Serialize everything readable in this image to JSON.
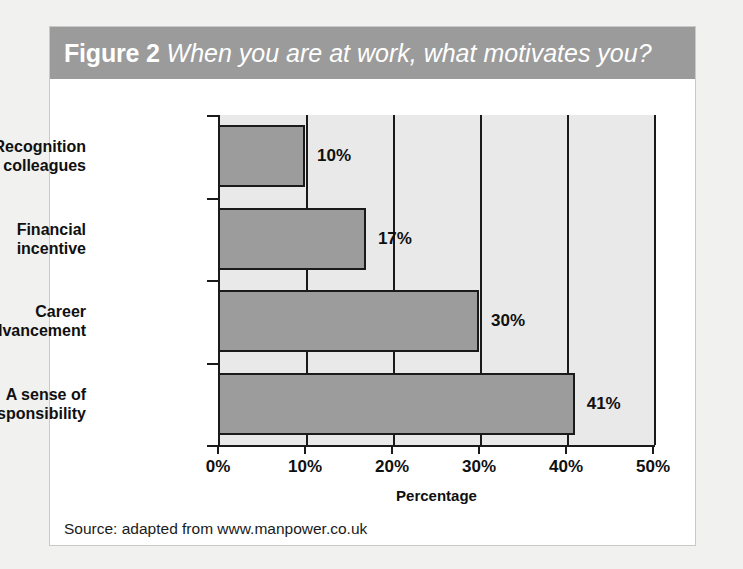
{
  "figure": {
    "number_label": "Figure 2",
    "question": "When you are at work, what motivates you?",
    "source": "Source: adapted from www.manpower.co.uk",
    "header_color": "#9b9b9b",
    "bar_color": "#9c9c9c",
    "plot_background": "#e9e9e9",
    "page_background": "#f1f1f0"
  },
  "chart_data": {
    "type": "bar",
    "orientation": "horizontal",
    "title": "When you are at work, what motivates you?",
    "categories": [
      "Recognition from colleagues",
      "Financial incentive",
      "Career advancement",
      "A sense of responsibility"
    ],
    "category_lines": [
      [
        "Recognition",
        "from colleagues"
      ],
      [
        "Financial",
        "incentive"
      ],
      [
        "Career",
        "advancement"
      ],
      [
        "A sense of",
        "responsibility"
      ]
    ],
    "values": [
      10,
      17,
      30,
      41
    ],
    "value_labels": [
      "10%",
      "17%",
      "30%",
      "41%"
    ],
    "xlabel": "Percentage",
    "ylabel": "",
    "xlim": [
      0,
      50
    ],
    "xticks": [
      0,
      10,
      20,
      30,
      40,
      50
    ],
    "xtick_labels": [
      "0%",
      "10%",
      "20%",
      "30%",
      "40%",
      "50%"
    ],
    "grid": true,
    "legend": false
  }
}
